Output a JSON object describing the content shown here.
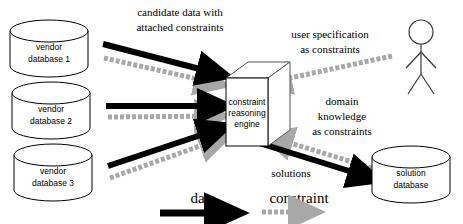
{
  "diagram": {
    "colors": {
      "data_arrow": "#000000",
      "constraint_arrow": "#a8a8a8",
      "shape_outline": "#000000",
      "cube_outline": "#555555",
      "background": "#ffffff"
    },
    "nodes": [
      {
        "id": "vendor-db-1",
        "type": "cylinder",
        "line1": "vendor",
        "line2": "database 1"
      },
      {
        "id": "vendor-db-2",
        "type": "cylinder",
        "line1": "vendor",
        "line2": "database 2"
      },
      {
        "id": "vendor-db-3",
        "type": "cylinder",
        "line1": "vendor",
        "line2": "database 3"
      },
      {
        "id": "engine",
        "type": "cube",
        "line1": "constraint",
        "line2": "reasoning",
        "line3": "engine"
      },
      {
        "id": "solution-db",
        "type": "cylinder",
        "line1": "solution",
        "line2": "database"
      },
      {
        "id": "user-actor",
        "type": "actor",
        "label": ""
      }
    ],
    "edge_labels": [
      {
        "id": "candidate-data",
        "line1": "candidate data with",
        "line2": "attached constraints"
      },
      {
        "id": "user-spec",
        "line1": "user specification",
        "line2": "as constraints"
      },
      {
        "id": "domain-knowledge",
        "line1": "domain",
        "line2": "knowledge",
        "line3": "as constraints"
      },
      {
        "id": "solutions",
        "line1": "solutions"
      }
    ],
    "legend": {
      "data": "data",
      "constraint": "constraint"
    }
  }
}
